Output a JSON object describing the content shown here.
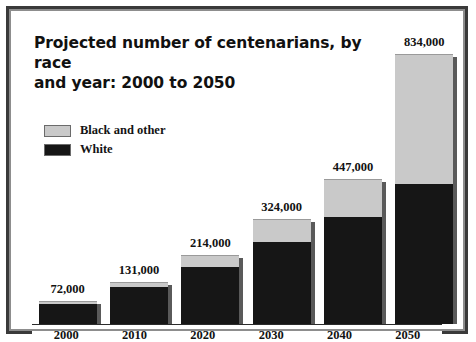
{
  "figure": {
    "title": "Projected number of centenarians, by race and year: 2000 to 2050",
    "title_line1": "Projected number of centenarians, by race",
    "title_line2": "and year: 2000 to 2050"
  },
  "legend": {
    "items": [
      {
        "label": "Black and other",
        "color": "#c9c9c9"
      },
      {
        "label": "White",
        "color": "#161616"
      }
    ]
  },
  "axis": {
    "ticks": [
      "2000",
      "2010",
      "2020",
      "2030",
      "2040",
      "2050"
    ]
  },
  "labels": {
    "values": [
      "72,000",
      "131,000",
      "214,000",
      "324,000",
      "447,000",
      "834,000"
    ]
  },
  "chart_data": {
    "type": "bar",
    "title": "Projected number of centenarians, by race and year: 2000 to 2050",
    "xlabel": "",
    "ylabel": "",
    "stacked": true,
    "grid": false,
    "legend_position": "upper-left",
    "categories": [
      "2000",
      "2010",
      "2020",
      "2030",
      "2040",
      "2050"
    ],
    "totals": [
      72000,
      131000,
      214000,
      324000,
      447000,
      834000
    ],
    "total_labels": [
      "72,000",
      "131,000",
      "214,000",
      "324,000",
      "447,000",
      "834,000"
    ],
    "ylim": [
      0,
      900000
    ],
    "series": [
      {
        "name": "White",
        "color": "#161616",
        "values": [
          64000,
          114000,
          176000,
          252000,
          330000,
          432000
        ]
      },
      {
        "name": "Black and other",
        "color": "#c9c9c9",
        "values": [
          8000,
          17000,
          38000,
          72000,
          117000,
          402000
        ]
      }
    ]
  },
  "render": {
    "bars": [
      {
        "year": "2000",
        "label": "72,000",
        "total_pct": 8.6,
        "dark_pct": 88,
        "light_pct": 12
      },
      {
        "year": "2010",
        "label": "131,000",
        "total_pct": 15.7,
        "dark_pct": 87,
        "light_pct": 13
      },
      {
        "year": "2020",
        "label": "214,000",
        "total_pct": 25.7,
        "dark_pct": 82,
        "light_pct": 18
      },
      {
        "year": "2030",
        "label": "324,000",
        "total_pct": 38.8,
        "dark_pct": 78,
        "light_pct": 22
      },
      {
        "year": "2040",
        "label": "447,000",
        "total_pct": 53.6,
        "dark_pct": 74,
        "light_pct": 26
      },
      {
        "year": "2050",
        "label": "834,000",
        "total_pct": 100,
        "dark_pct": 52,
        "light_pct": 48
      }
    ]
  }
}
